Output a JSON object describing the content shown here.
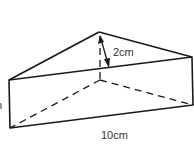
{
  "diagram": {
    "type": "triangular-prism",
    "labels": {
      "height_label": "2cm",
      "length_label": "10cm",
      "left_label_partial": "n"
    },
    "colors": {
      "line": "#1a1a1a",
      "text": "#333333",
      "background": "#ffffff"
    }
  }
}
